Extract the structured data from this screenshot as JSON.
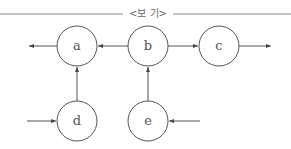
{
  "header": {
    "title": "<보 기>"
  },
  "nodes": [
    {
      "id": "a",
      "label": "a",
      "cx": 77,
      "cy": 46
    },
    {
      "id": "b",
      "label": "b",
      "cx": 148,
      "cy": 46
    },
    {
      "id": "c",
      "label": "c",
      "cx": 219,
      "cy": 46
    },
    {
      "id": "d",
      "label": "d",
      "cx": 77,
      "cy": 121
    },
    {
      "id": "e",
      "label": "e",
      "cx": 148,
      "cy": 121
    }
  ],
  "edges": [
    {
      "from": "a",
      "to": "out-left"
    },
    {
      "from": "b",
      "to": "a"
    },
    {
      "from": "b",
      "to": "c"
    },
    {
      "from": "c",
      "to": "out-right"
    },
    {
      "from": "d",
      "to": "a"
    },
    {
      "from": "e",
      "to": "b"
    },
    {
      "from": "in-left",
      "to": "d"
    },
    {
      "from": "in-right",
      "to": "e"
    }
  ],
  "colors": {
    "stroke": "#555555",
    "background": "#ffffff"
  }
}
